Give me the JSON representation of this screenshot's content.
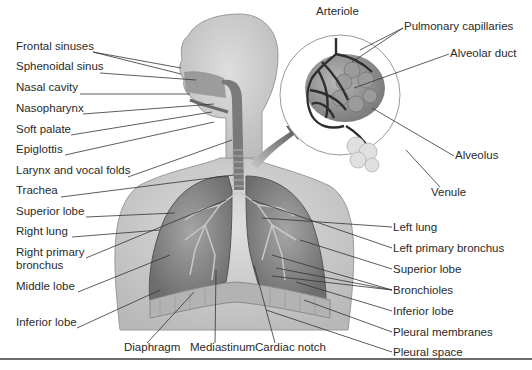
{
  "colors": {
    "body_fill": "#d4d4d4",
    "body_shadow": "#a9a9a9",
    "lung_fill": "#8f8f8f",
    "lung_dark": "#5c5c5c",
    "label_text": "#2a2a2a",
    "leader_line": "#333333",
    "rule": "#6b6b6b"
  },
  "labels": {
    "left": [
      {
        "text": "Frontal sinuses",
        "x": 16,
        "y": 46
      },
      {
        "text": "Sphenoidal sinus",
        "x": 16,
        "y": 66
      },
      {
        "text": "Nasal cavity",
        "x": 16,
        "y": 87
      },
      {
        "text": "Nasopharynx",
        "x": 16,
        "y": 108
      },
      {
        "text": "Soft palate",
        "x": 16,
        "y": 129
      },
      {
        "text": "Epiglottis",
        "x": 16,
        "y": 149
      },
      {
        "text": "Larynx and vocal folds",
        "x": 16,
        "y": 170
      },
      {
        "text": "Trachea",
        "x": 16,
        "y": 190
      },
      {
        "text": "Superior lobe",
        "x": 16,
        "y": 211
      },
      {
        "text": "Right lung",
        "x": 16,
        "y": 231
      },
      {
        "text": "Right primary",
        "x": 16,
        "y": 252
      },
      {
        "text": "bronchus",
        "x": 16,
        "y": 265
      },
      {
        "text": "Middle lobe",
        "x": 16,
        "y": 286
      },
      {
        "text": "Inferior lobe",
        "x": 16,
        "y": 321
      }
    ],
    "bottom": [
      {
        "text": "Diaphragm",
        "x": 124,
        "y": 347
      },
      {
        "text": "Mediastinum",
        "x": 190,
        "y": 347
      },
      {
        "text": "Cardiac notch",
        "x": 255,
        "y": 347
      }
    ],
    "right": [
      {
        "text": "Left lung",
        "x": 393,
        "y": 220
      },
      {
        "text": "Left primary bronchus",
        "x": 393,
        "y": 241
      },
      {
        "text": "Superior lobe",
        "x": 393,
        "y": 262
      },
      {
        "text": "Bronchioles",
        "x": 393,
        "y": 283
      },
      {
        "text": "Inferior lobe",
        "x": 393,
        "y": 304
      },
      {
        "text": "Pleural membranes",
        "x": 393,
        "y": 325
      },
      {
        "text": "Pleural space",
        "x": 393,
        "y": 346
      }
    ],
    "inset": [
      {
        "text": "Arteriole",
        "x": 316,
        "y": 6
      },
      {
        "text": "Pulmonary capillaries",
        "x": 404,
        "y": 22
      },
      {
        "text": "Alveolar duct",
        "x": 450,
        "y": 48
      },
      {
        "text": "Alveolus",
        "x": 455,
        "y": 150
      },
      {
        "text": "Venule",
        "x": 431,
        "y": 188
      }
    ]
  }
}
